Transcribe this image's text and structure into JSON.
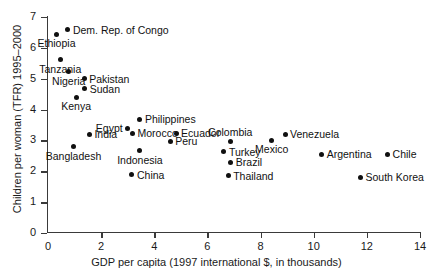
{
  "chart_data": {
    "type": "scatter",
    "title": "",
    "xlabel": "GDP per capita (1997 international $, in thousands)",
    "ylabel": "Children per woman (TFR) 1995–2000",
    "xlim": [
      0,
      14
    ],
    "ylim": [
      0,
      7
    ],
    "xticks": [
      0,
      2,
      4,
      6,
      8,
      10,
      12,
      14
    ],
    "yticks": [
      0,
      1,
      2,
      3,
      4,
      5,
      6,
      7
    ],
    "xtick_labels": [
      "0",
      "2",
      "4",
      "6",
      "8",
      "10",
      "12",
      "14"
    ],
    "ytick_labels": [
      "0",
      "1",
      "2",
      "3",
      "4",
      "5",
      "6",
      "7"
    ],
    "grid": false,
    "legend": false,
    "marker_color": "#101010",
    "axis_color": "#3a3a3a",
    "points": [
      {
        "label": "Dem. Rep. of Congo",
        "x": 0.75,
        "y": 6.58,
        "pos": "right"
      },
      {
        "label": "Ethiopia",
        "x": 0.32,
        "y": 6.44,
        "pos": "below"
      },
      {
        "label": "Tanzania",
        "x": 0.46,
        "y": 5.62,
        "pos": "below"
      },
      {
        "label": "Nigeria",
        "x": 0.78,
        "y": 5.22,
        "pos": "below"
      },
      {
        "label": "Pakistan",
        "x": 1.36,
        "y": 5.0,
        "pos": "right"
      },
      {
        "label": "Sudan",
        "x": 1.38,
        "y": 4.68,
        "pos": "right"
      },
      {
        "label": "Kenya",
        "x": 1.06,
        "y": 4.4,
        "pos": "below"
      },
      {
        "label": "Egypt",
        "x": 3.0,
        "y": 3.4,
        "pos": "left"
      },
      {
        "label": "Philippines",
        "x": 3.46,
        "y": 3.69,
        "pos": "right"
      },
      {
        "label": "India",
        "x": 1.56,
        "y": 3.2,
        "pos": "right"
      },
      {
        "label": "Morocco",
        "x": 3.18,
        "y": 3.24,
        "pos": "right"
      },
      {
        "label": "Ecuador",
        "x": 4.82,
        "y": 3.24,
        "pos": "right"
      },
      {
        "label": "Peru",
        "x": 4.6,
        "y": 2.97,
        "pos": "right"
      },
      {
        "label": "Colombia",
        "x": 6.86,
        "y": 2.97,
        "pos": "above"
      },
      {
        "label": "Venezuela",
        "x": 8.92,
        "y": 3.2,
        "pos": "right"
      },
      {
        "label": "Mexico",
        "x": 8.42,
        "y": 3.0,
        "pos": "below"
      },
      {
        "label": "Bangladesh",
        "x": 0.96,
        "y": 2.79,
        "pos": "below"
      },
      {
        "label": "Indonesia",
        "x": 3.46,
        "y": 2.67,
        "pos": "below"
      },
      {
        "label": "Turkey",
        "x": 6.62,
        "y": 2.64,
        "pos": "right"
      },
      {
        "label": "Argentina",
        "x": 10.3,
        "y": 2.55,
        "pos": "right"
      },
      {
        "label": "Chile",
        "x": 12.78,
        "y": 2.55,
        "pos": "right"
      },
      {
        "label": "Brazil",
        "x": 6.88,
        "y": 2.29,
        "pos": "right"
      },
      {
        "label": "China",
        "x": 3.16,
        "y": 1.88,
        "pos": "right"
      },
      {
        "label": "Thailand",
        "x": 6.78,
        "y": 1.85,
        "pos": "right"
      },
      {
        "label": "South Korea",
        "x": 11.76,
        "y": 1.8,
        "pos": "right"
      }
    ]
  }
}
